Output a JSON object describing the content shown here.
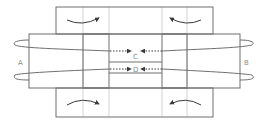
{
  "diagram": {
    "labels": {
      "A": "A",
      "B": "B",
      "C": "C",
      "D": "D"
    },
    "colors": {
      "outline": "#6f6f6f",
      "gridline": "#c8c8c8",
      "arrow": "#3a3a3a",
      "label": "#8a8a8a"
    },
    "elements": [
      {
        "id": "top-flap",
        "type": "region"
      },
      {
        "id": "middle-band",
        "type": "region"
      },
      {
        "id": "bottom-flap",
        "type": "region"
      },
      {
        "id": "left-square",
        "type": "region"
      },
      {
        "id": "right-square",
        "type": "region"
      },
      {
        "id": "center-channel-C",
        "type": "region"
      },
      {
        "id": "center-channel-D",
        "type": "region"
      },
      {
        "id": "loop-upper-left",
        "type": "loop-arrow"
      },
      {
        "id": "loop-lower-left",
        "type": "loop-arrow"
      },
      {
        "id": "loop-upper-right",
        "type": "loop-arrow"
      },
      {
        "id": "loop-lower-right",
        "type": "loop-arrow"
      },
      {
        "id": "curved-arrow-top-left",
        "type": "arrow",
        "direction": "right"
      },
      {
        "id": "curved-arrow-top-right",
        "type": "arrow",
        "direction": "left"
      },
      {
        "id": "curved-arrow-bottom-left",
        "type": "arrow",
        "direction": "right"
      },
      {
        "id": "curved-arrow-bottom-right",
        "type": "arrow",
        "direction": "left"
      },
      {
        "id": "dotted-arrow-C-left",
        "type": "arrow",
        "direction": "right"
      },
      {
        "id": "dotted-arrow-C-right",
        "type": "arrow",
        "direction": "left"
      },
      {
        "id": "dotted-arrow-D-left",
        "type": "arrow",
        "direction": "right"
      },
      {
        "id": "dotted-arrow-D-right",
        "type": "arrow",
        "direction": "left"
      }
    ]
  }
}
